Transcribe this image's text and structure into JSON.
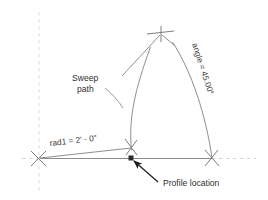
{
  "drawing": {
    "title": "Sweep path geometry diagram",
    "labels": {
      "radius_dimension": "rad1 = 2' - 0\"",
      "angle_dimension": "angle = 45.00°",
      "sweep_path_line1": "Sweep",
      "sweep_path_line2": "path",
      "profile_location": "Profile location"
    },
    "colors": {
      "geometry_line": "#8a8a8a",
      "dimension_line": "#8f8f8f",
      "axis_dashed": "#d8d8d8",
      "text": "#333333",
      "leader": "#5a5a5a",
      "arrow": "#1a1a1a",
      "profile_point": "#2a2a2a",
      "background": "#ffffff"
    },
    "geometry": {
      "center_point": "38, 158",
      "profile_point": "131, 158",
      "arc_end_point": "212, 158",
      "apex_point": "161, 33",
      "radius_value": "2' - 0\"",
      "angle_value": "45.00°"
    }
  }
}
